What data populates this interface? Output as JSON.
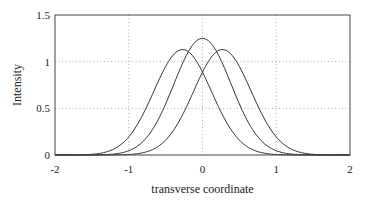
{
  "chart_data": {
    "type": "line",
    "title": "",
    "xlabel": "transverse coordinate",
    "ylabel": "Intensity",
    "xlim": [
      -2,
      2
    ],
    "ylim": [
      0,
      1.5
    ],
    "xticks": [
      -2,
      -1,
      0,
      1,
      2
    ],
    "xtick_labels": [
      "-2",
      "-1",
      "0",
      "1",
      "2"
    ],
    "yticks": [
      0,
      0.5,
      1,
      1.5
    ],
    "ytick_labels": [
      "0",
      "0.5",
      "1",
      "1.5"
    ],
    "grid": "dotted",
    "legend": null,
    "series": [
      {
        "name": "left-shifted",
        "center": -0.27,
        "peak": 1.13,
        "width": 0.55,
        "x": [
          -2,
          -1.5,
          -1,
          -0.75,
          -0.5,
          -0.27,
          0,
          0.25,
          0.5,
          0.75,
          1,
          1.5,
          2
        ],
        "y": [
          0.0,
          0.03,
          0.35,
          0.65,
          1.0,
          1.13,
          1.0,
          0.72,
          0.45,
          0.22,
          0.09,
          0.005,
          0.0
        ]
      },
      {
        "name": "center",
        "center": 0,
        "peak": 1.25,
        "width": 0.55,
        "x": [
          -2,
          -1.5,
          -1,
          -0.75,
          -0.5,
          -0.25,
          0,
          0.25,
          0.5,
          0.75,
          1,
          1.5,
          2
        ],
        "y": [
          0.0,
          0.01,
          0.2,
          0.5,
          0.85,
          1.1,
          1.25,
          1.1,
          0.85,
          0.5,
          0.2,
          0.01,
          0.0
        ]
      },
      {
        "name": "right-shifted",
        "center": 0.27,
        "peak": 1.13,
        "width": 0.55,
        "x": [
          -2,
          -1.5,
          -1,
          -0.75,
          -0.5,
          -0.25,
          0,
          0.27,
          0.5,
          0.75,
          1,
          1.5,
          2
        ],
        "y": [
          0.0,
          0.005,
          0.09,
          0.22,
          0.45,
          0.72,
          1.0,
          1.13,
          1.0,
          0.65,
          0.35,
          0.03,
          0.0
        ]
      }
    ],
    "line_color": "#333333",
    "grid_color": "#999999"
  }
}
